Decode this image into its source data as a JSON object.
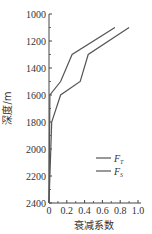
{
  "chart_data": {
    "type": "line",
    "title": "",
    "xlabel": "衰减系数",
    "ylabel": "深度/m",
    "xlim": [
      0,
      1.0
    ],
    "ylim": [
      2400,
      1000
    ],
    "y_inverted": true,
    "grid": false,
    "legend_position": "lower right (inside)",
    "x_ticks": [
      "0",
      "0.2",
      "0.4",
      "0.6",
      "0.8",
      "1.0"
    ],
    "y_ticks": [
      "1000",
      "1200",
      "1400",
      "1600",
      "1800",
      "2000",
      "2200",
      "2400"
    ],
    "series": [
      {
        "name": "F_T",
        "label_main": "F",
        "label_sub": "T",
        "points": [
          {
            "x": 0.74,
            "depth": 1100
          },
          {
            "x": 0.26,
            "depth": 1300
          },
          {
            "x": 0.13,
            "depth": 1500
          },
          {
            "x": 0.01,
            "depth": 1600
          },
          {
            "x": 0.0,
            "depth": 2400
          }
        ]
      },
      {
        "name": "F_S",
        "label_main": "F",
        "label_sub": "S",
        "points": [
          {
            "x": 0.9,
            "depth": 1100
          },
          {
            "x": 0.44,
            "depth": 1300
          },
          {
            "x": 0.35,
            "depth": 1500
          },
          {
            "x": 0.13,
            "depth": 1600
          },
          {
            "x": 0.03,
            "depth": 1800
          },
          {
            "x": 0.0,
            "depth": 2400
          }
        ]
      }
    ]
  }
}
